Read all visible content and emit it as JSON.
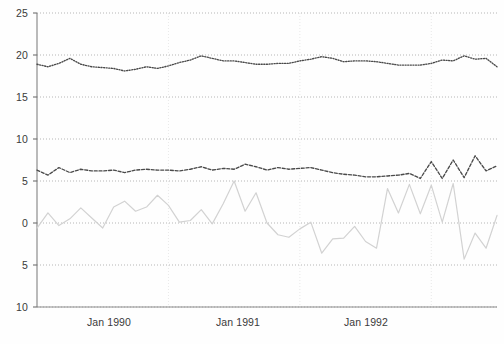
{
  "chart_data": {
    "type": "line",
    "title": "",
    "subtitle": "",
    "xlabel": "",
    "ylabel": "",
    "ylim": [
      -10,
      25
    ],
    "xlim": [
      0,
      42
    ],
    "grid": "dotted horizontal gridlines at every 5 units; faint vertical gridlines at each January",
    "legend_position": "none",
    "y_ticks": [
      25,
      20,
      15,
      10,
      5,
      0,
      -5,
      -10
    ],
    "y_tick_labels": [
      "25",
      "20",
      "15",
      "10",
      "5",
      "0",
      "5",
      "10"
    ],
    "x_tick_labels": [
      "Jan 1990",
      "Jan 1991",
      "Jan 1992"
    ],
    "x_tick_positions": [
      12,
      24,
      36
    ],
    "x_start_label": "Jan 1989",
    "x_unit": "month",
    "n_points": 43,
    "series": [
      {
        "name": "upper-series",
        "style": "dotted",
        "color": "#4a4a4a",
        "values": [
          18.9,
          18.6,
          19.0,
          19.6,
          18.9,
          18.6,
          18.5,
          18.4,
          18.1,
          18.3,
          18.6,
          18.4,
          18.7,
          19.1,
          19.4,
          19.9,
          19.6,
          19.3,
          19.3,
          19.1,
          18.9,
          18.9,
          19.0,
          19.0,
          19.3,
          19.5,
          19.8,
          19.6,
          19.2,
          19.3,
          19.3,
          19.2,
          19.0,
          18.8,
          18.8,
          18.8,
          19.0,
          19.4,
          19.3,
          19.9,
          19.5,
          19.6,
          18.6
        ]
      },
      {
        "name": "middle-series",
        "style": "dashed",
        "color": "#4a4a4a",
        "values": [
          6.3,
          5.7,
          6.6,
          6.0,
          6.4,
          6.2,
          6.2,
          6.3,
          6.0,
          6.3,
          6.4,
          6.3,
          6.3,
          6.2,
          6.4,
          6.7,
          6.3,
          6.5,
          6.4,
          7.0,
          6.7,
          6.3,
          6.6,
          6.4,
          6.5,
          6.6,
          6.3,
          6.0,
          5.8,
          5.7,
          5.5,
          5.5,
          5.6,
          5.7,
          5.9,
          5.3,
          7.3,
          5.3,
          7.5,
          5.4,
          8.0,
          6.2,
          6.8
        ]
      },
      {
        "name": "lower-series",
        "style": "solid",
        "color": "#d2d2d2",
        "values": [
          -0.6,
          1.2,
          -0.3,
          0.5,
          1.8,
          0.6,
          -0.6,
          1.9,
          2.6,
          1.4,
          1.9,
          3.3,
          2.1,
          0.1,
          0.3,
          1.6,
          -0.1,
          2.3,
          5.0,
          1.4,
          3.6,
          0.0,
          -1.4,
          -1.7,
          -0.7,
          0.1,
          -3.6,
          -1.9,
          -1.8,
          -0.4,
          -2.2,
          -3.0,
          4.1,
          1.2,
          4.6,
          1.1,
          4.5,
          0.1,
          4.7,
          -4.3,
          -1.2,
          -3.0,
          0.9
        ]
      }
    ]
  },
  "caption": ""
}
